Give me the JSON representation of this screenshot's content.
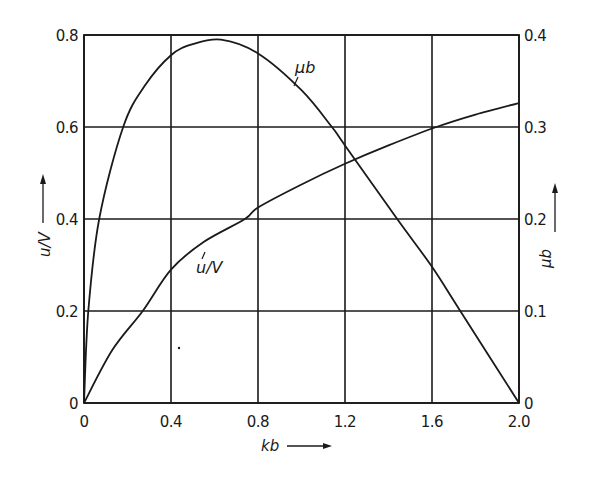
{
  "chart_data": {
    "type": "line",
    "title": "",
    "xlabel": "kb",
    "ylabel_left": "u/V",
    "ylabel_right": "μb",
    "xlim": [
      0,
      2.0
    ],
    "ylim_left": [
      0,
      0.8
    ],
    "ylim_right": [
      0,
      0.4
    ],
    "grid": true,
    "legend": "none (curves labelled inline)",
    "x_ticks": [
      "0",
      "0.4",
      "0.8",
      "1.2",
      "1.6",
      "2.0"
    ],
    "y_ticks_left": [
      "0",
      "0.2",
      "0.4",
      "0.6",
      "0.8"
    ],
    "y_ticks_right": [
      "0",
      "0.1",
      "0.2",
      "0.3",
      "0.4"
    ],
    "series": [
      {
        "name": "μb",
        "axis": "right",
        "label": "μb",
        "x": [
          0,
          0.02,
          0.07,
          0.18,
          0.28,
          0.4,
          0.5,
          0.63,
          0.8,
          1.0,
          1.14,
          1.2,
          1.44,
          1.6,
          1.73,
          2.0
        ],
        "y": [
          0,
          0.1,
          0.2,
          0.3,
          0.345,
          0.378,
          0.39,
          0.395,
          0.38,
          0.34,
          0.3,
          0.28,
          0.2,
          0.148,
          0.1,
          0
        ]
      },
      {
        "name": "u/V",
        "axis": "left",
        "label": "u/V",
        "x": [
          0,
          0.13,
          0.27,
          0.4,
          0.55,
          0.74,
          0.8,
          1.0,
          1.2,
          1.4,
          1.62,
          1.8,
          2.0
        ],
        "y": [
          0,
          0.115,
          0.2,
          0.29,
          0.35,
          0.4,
          0.425,
          0.475,
          0.52,
          0.56,
          0.6,
          0.627,
          0.652
        ]
      }
    ]
  },
  "labels": {
    "x_axis": "kb",
    "y_left": "u/V",
    "y_right": "μb",
    "curve_mu": "μb",
    "curve_u": "u/V"
  },
  "colors": {
    "ink": "#1a1a1a",
    "background": "#ffffff"
  }
}
